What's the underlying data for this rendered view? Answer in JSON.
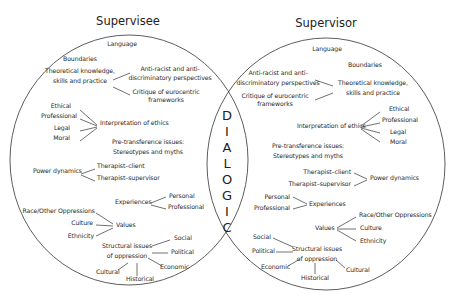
{
  "headings": {
    "left": "Supervisee",
    "right": "Supervisor"
  },
  "center": {
    "letters": [
      "D",
      "I",
      "A",
      "L",
      "O",
      "G",
      "I",
      "C"
    ],
    "word": "DIALOGIC"
  },
  "left": {
    "language": "Language",
    "boundaries": "Boundaries",
    "theory": [
      "Theoretical knowledge,",
      "skills and practice"
    ],
    "anti_racist": [
      "Anti-racist and anti-",
      "discriminatory perspectives"
    ],
    "critique": [
      "Critique of eurocentric",
      "frameworks"
    ],
    "ethics_items": [
      "Ethical",
      "Professional",
      "Legal",
      "Moral"
    ],
    "ethics": "Interpretation of ethics",
    "pretransference": [
      "Pre-transference issues:",
      "Stereotypes and myths"
    ],
    "power": "Power dynamics",
    "power_items": [
      "Therapist–client",
      "Therapist–supervisor"
    ],
    "experiences": "Experiences",
    "experience_items": [
      "Personal",
      "Professional"
    ],
    "values": "Values",
    "value_items": [
      "Race/Other Oppressions",
      "Culture",
      "Ethnicity"
    ],
    "structural": [
      "Structural issues",
      "of oppression"
    ],
    "structural_items": [
      "Social",
      "Political",
      "Economic",
      "Historical",
      "Cultural"
    ]
  },
  "right": {
    "language": "Language",
    "boundaries": "Boundaries",
    "theory": [
      "Theoretical knowledge,",
      "skills and practice"
    ],
    "anti_racist": [
      "Anti-racist and anti-",
      "discriminatory perspectives"
    ],
    "critique": [
      "Critique of eurocentric",
      "frameworks"
    ],
    "ethics_items": [
      "Ethical",
      "Professional",
      "Legal",
      "Moral"
    ],
    "ethics": "Interpretation of ethics",
    "pretransference": [
      "Pre-transference issues:",
      "Stereotypes and myths"
    ],
    "power": "Power dynamics",
    "power_items": [
      "Therapist–client",
      "Therapist–supervisor"
    ],
    "experiences": "Experiences",
    "experience_items": [
      "Personal",
      "Professional"
    ],
    "values": "Values",
    "value_items": [
      "Race/Other Oppressions",
      "Culture",
      "Ethnicity"
    ],
    "structural": [
      "Structural issues",
      "of oppression"
    ],
    "structural_items": [
      "Social",
      "Political",
      "Economic",
      "Historical",
      "Cultural"
    ]
  },
  "colors": {
    "line": "#333333",
    "text": "#2a2a2a",
    "background": "#ffffff"
  }
}
